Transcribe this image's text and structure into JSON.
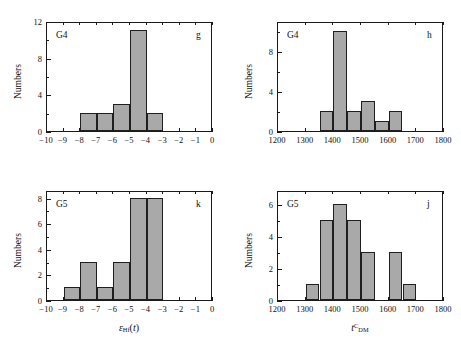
{
  "figure": {
    "axis_titles": {
      "y": "Numbers"
    },
    "bar_fill_color": "#a9a9a9",
    "bar_edge_color": "#1f1f1f",
    "axis_color": "#1a1a1a"
  },
  "chart_data": [
    {
      "type": "bar",
      "panel_letter": "g",
      "group_label": "G4",
      "title": "",
      "xlabel": "",
      "ylabel": "Numbers",
      "xlim": [
        -10,
        0
      ],
      "ylim": [
        0,
        12
      ],
      "xticks": [
        -10,
        -9,
        -8,
        -7,
        -6,
        -5,
        -4,
        -3,
        -2,
        -1,
        0
      ],
      "xticklabels": [
        "-10",
        "-9",
        "-8",
        "-7",
        "-6",
        "-5",
        "-4",
        "-3",
        "-2",
        "-1",
        "0"
      ],
      "yticks": [
        0,
        4,
        8,
        12
      ],
      "yticklabels": [
        "0",
        "4",
        "8",
        "12"
      ],
      "yminorticks": [
        2,
        6,
        10
      ],
      "bin_width": 1,
      "bin_edges": [
        -8,
        -7,
        -6,
        -5,
        -4,
        -3
      ],
      "categories": [
        "-8..-7",
        "-7..-6",
        "-6..-5",
        "-5..-4",
        "-4..-3"
      ],
      "values": [
        2,
        2,
        3,
        11,
        2
      ],
      "grid": false,
      "legend": "none"
    },
    {
      "type": "bar",
      "panel_letter": "h",
      "group_label": "G4",
      "title": "",
      "xlabel": "",
      "ylabel": "Numbers",
      "xlim": [
        1200,
        1800
      ],
      "ylim": [
        0,
        11
      ],
      "xticks": [
        1200,
        1300,
        1400,
        1500,
        1600,
        1700,
        1800
      ],
      "xticklabels": [
        "1200",
        "1300",
        "1400",
        "1500",
        "1600",
        "1700",
        "1800"
      ],
      "yticks": [
        0,
        4,
        8
      ],
      "yticklabels": [
        "0",
        "4",
        "8"
      ],
      "yminorticks": [
        2,
        6,
        10
      ],
      "bin_width": 50,
      "bin_edges": [
        1350,
        1400,
        1450,
        1500,
        1550,
        1600,
        1650
      ],
      "categories": [
        "1350-1400",
        "1400-1450",
        "1450-1500",
        "1500-1550",
        "1550-1600",
        "1600-1650"
      ],
      "values": [
        2,
        10,
        2,
        3,
        1,
        2
      ],
      "grid": false,
      "legend": "none"
    },
    {
      "type": "bar",
      "panel_letter": "k",
      "group_label": "G5",
      "title": "",
      "xlabel": "eHf(t)",
      "ylabel": "Numbers",
      "xlim": [
        -10,
        0
      ],
      "ylim": [
        0,
        8.6
      ],
      "xticks": [
        -10,
        -9,
        -8,
        -7,
        -6,
        -5,
        -4,
        -3,
        -2,
        -1,
        0
      ],
      "xticklabels": [
        "-10",
        "-9",
        "-8",
        "-7",
        "-6",
        "-5",
        "-4",
        "-3",
        "-2",
        "-1",
        "0"
      ],
      "yticks": [
        0,
        2,
        4,
        6,
        8
      ],
      "yticklabels": [
        "0",
        "2",
        "4",
        "6",
        "8"
      ],
      "yminorticks": [
        1,
        3,
        5,
        7
      ],
      "bin_width": 1,
      "bin_edges": [
        -9,
        -8,
        -7,
        -6,
        -5,
        -4,
        -3
      ],
      "categories": [
        "-9..-8",
        "-8..-7",
        "-7..-6",
        "-6..-5",
        "-5..-4",
        "-4..-3"
      ],
      "values": [
        1,
        3,
        1,
        3,
        8,
        8
      ],
      "grid": false,
      "legend": "none"
    },
    {
      "type": "bar",
      "panel_letter": "j",
      "group_label": "G5",
      "title": "",
      "xlabel": "tCDM",
      "ylabel": "Numbers",
      "xlim": [
        1200,
        1800
      ],
      "ylim": [
        0,
        6.9
      ],
      "xticks": [
        1200,
        1300,
        1400,
        1500,
        1600,
        1700,
        1800
      ],
      "xticklabels": [
        "1200",
        "1300",
        "1400",
        "1500",
        "1600",
        "1700",
        "1800"
      ],
      "yticks": [
        0,
        2,
        4,
        6
      ],
      "yticklabels": [
        "0",
        "2",
        "4",
        "6"
      ],
      "yminorticks": [
        1,
        3,
        5
      ],
      "bin_width": 50,
      "bin_edges": [
        1300,
        1350,
        1400,
        1450,
        1500,
        1550,
        1600,
        1650,
        1700
      ],
      "categories": [
        "1300-1350",
        "1350-1400",
        "1400-1450",
        "1450-1500",
        "1500-1550",
        "1550-1600",
        "1600-1650",
        "1650-1700"
      ],
      "values": [
        1,
        5,
        6,
        5,
        3,
        0,
        3,
        1
      ],
      "grid": false,
      "legend": "none"
    }
  ]
}
